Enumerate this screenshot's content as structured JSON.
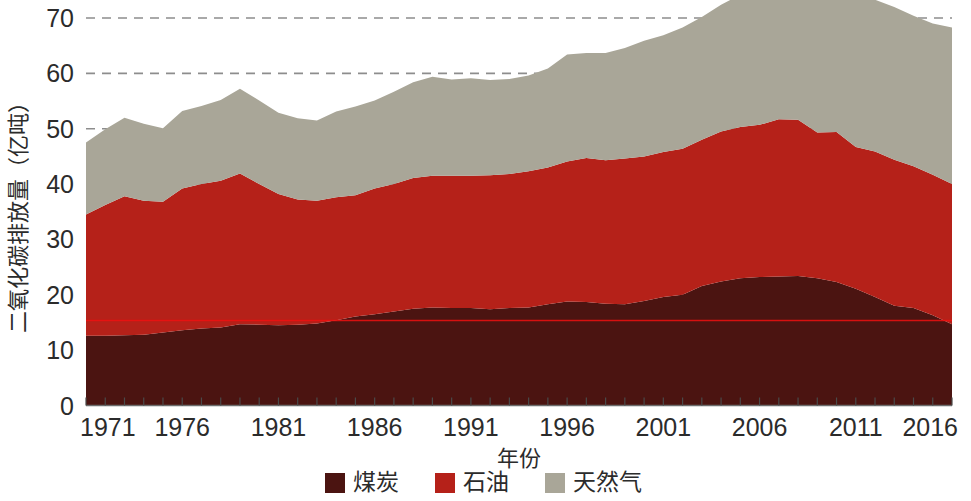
{
  "chart_data": {
    "type": "area",
    "title": "",
    "xlabel": "年份",
    "ylabel": "二氧化碳排放量（亿吨）",
    "xlim": [
      1971,
      2016
    ],
    "ylim": [
      0,
      70
    ],
    "ytick_labels": [
      "0",
      "10",
      "20",
      "30",
      "40",
      "50",
      "60",
      "70"
    ],
    "ytick_values": [
      0,
      10,
      20,
      30,
      40,
      50,
      60,
      70
    ],
    "xtick_labels": [
      "1971",
      "1976",
      "1981",
      "1986",
      "1991",
      "1996",
      "2001",
      "2006",
      "2011",
      "2016"
    ],
    "xtick_values": [
      1971,
      1976,
      1981,
      1986,
      1991,
      1996,
      2001,
      2006,
      2011,
      2016
    ],
    "grid": true,
    "stacked": true,
    "legend_position": "bottom",
    "x": [
      1971,
      1972,
      1973,
      1974,
      1975,
      1976,
      1977,
      1978,
      1979,
      1980,
      1981,
      1982,
      1983,
      1984,
      1985,
      1986,
      1987,
      1988,
      1989,
      1990,
      1991,
      1992,
      1993,
      1994,
      1995,
      1996,
      1997,
      1998,
      1999,
      2000,
      2001,
      2002,
      2003,
      2004,
      2005,
      2006,
      2007,
      2008,
      2009,
      2010,
      2011,
      2012,
      2013,
      2014,
      2015,
      2016
    ],
    "series": [
      {
        "name": "煤炭",
        "color": "#4b1411",
        "values": [
          12.6,
          12.6,
          12.7,
          12.8,
          13.2,
          13.6,
          13.9,
          14.1,
          14.7,
          14.6,
          14.5,
          14.6,
          14.8,
          15.4,
          16.1,
          16.5,
          17.0,
          17.5,
          17.7,
          17.6,
          17.6,
          17.4,
          17.6,
          17.7,
          18.3,
          18.8,
          18.7,
          18.4,
          18.3,
          18.9,
          19.6,
          20.0,
          21.6,
          22.4,
          23.0,
          23.2,
          23.3,
          23.4,
          23.0,
          22.3,
          21.1,
          19.6,
          18.0,
          17.6,
          16.3,
          14.7
        ]
      },
      {
        "name": "石油",
        "color": "#b52119",
        "values": [
          21.9,
          23.6,
          25.1,
          24.2,
          23.6,
          25.6,
          26.1,
          26.5,
          27.2,
          25.4,
          23.7,
          22.6,
          22.2,
          22.2,
          21.9,
          22.7,
          23.0,
          23.6,
          23.8,
          23.9,
          23.9,
          24.2,
          24.2,
          24.6,
          24.7,
          25.3,
          26.0,
          25.9,
          26.3,
          26.1,
          26.2,
          26.4,
          26.4,
          27.1,
          27.3,
          27.5,
          28.4,
          28.2,
          26.3,
          27.1,
          25.6,
          26.3,
          26.4,
          25.6,
          25.4,
          25.3
        ]
      },
      {
        "name": "天然气",
        "color": "#a9a698",
        "values": [
          13.0,
          13.7,
          14.2,
          13.9,
          13.3,
          14.0,
          14.1,
          14.6,
          15.3,
          15.1,
          14.7,
          14.7,
          14.5,
          15.5,
          16.0,
          15.9,
          16.7,
          17.3,
          17.9,
          17.4,
          17.6,
          17.2,
          17.2,
          17.3,
          17.9,
          19.3,
          19.0,
          19.4,
          20.0,
          20.9,
          21.1,
          21.9,
          22.2,
          22.9,
          23.9,
          24.2,
          25.3,
          25.4,
          24.5,
          26.6,
          27.0,
          27.4,
          27.6,
          27.2,
          27.3,
          28.3
        ]
      }
    ],
    "totals": [
      47.5,
      49.9,
      52.0,
      50.9,
      50.1,
      53.2,
      54.1,
      55.2,
      57.2,
      55.1,
      52.9,
      51.9,
      51.5,
      53.1,
      54.0,
      55.1,
      56.7,
      58.4,
      59.4,
      58.9,
      59.1,
      58.8,
      59.0,
      59.6,
      60.9,
      63.4,
      63.7,
      63.7,
      64.6,
      65.9,
      66.9,
      68.3,
      70.2,
      72.4,
      74.2,
      74.9,
      77.0,
      77.0,
      73.8,
      76.0,
      73.7,
      73.3,
      72.0,
      70.4,
      69.0,
      68.3
    ]
  },
  "legend": {
    "items": [
      {
        "label": "煤炭",
        "color": "#4b1411"
      },
      {
        "label": "石油",
        "color": "#b52119"
      },
      {
        "label": "天然气",
        "color": "#a9a698"
      }
    ]
  },
  "axes": {
    "y_title": "二氧化碳排放量（亿吨）",
    "x_title": "年份"
  }
}
